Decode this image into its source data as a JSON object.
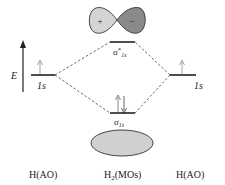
{
  "diagram": {
    "energy_axis_label": "E",
    "left": {
      "column_label": "H(AO)",
      "orbital_label": "1s",
      "electrons": 1
    },
    "right": {
      "column_label": "H(AO)",
      "orbital_label": "1s",
      "electrons": 1
    },
    "center": {
      "column_label_main": "H",
      "column_label_sub": "2",
      "column_label_rest": "(MOs)",
      "antibonding": {
        "symbol": "σ",
        "star": "*",
        "subscript": "1s",
        "electrons": 0,
        "lobe_left_sign": "+",
        "lobe_right_sign": "−"
      },
      "bonding": {
        "symbol": "σ",
        "subscript": "1s",
        "electrons": 2
      }
    },
    "colors": {
      "line": "#222222",
      "lobe_light": "#d4d4d4",
      "lobe_dark": "#8a8a8a",
      "bonding_fill": "#d0d0d0",
      "electron_arrow_light": "#999999",
      "electron_arrow_dark": "#555555"
    }
  }
}
